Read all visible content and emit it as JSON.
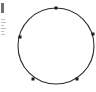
{
  "figure": {
    "background_color": "#ffffff",
    "width": 96,
    "height": 92
  },
  "chart_data": {
    "type": "scatter",
    "subtitle": "",
    "xlabel": "",
    "ylabel": "",
    "grid": false,
    "legend_position": "none",
    "xlim": [
      0,
      96
    ],
    "ylim": [
      0,
      92
    ],
    "shapes": [
      {
        "kind": "circle",
        "label": "outline-circle",
        "cx": 56,
        "cy": 46,
        "r": 38,
        "stroke": "#2b2b2b",
        "stroke_width": 1.1,
        "fill": "none"
      }
    ],
    "categories": [
      "p1",
      "p2",
      "p3",
      "p4",
      "p5"
    ],
    "points": [
      {
        "label": "p1",
        "x": 56,
        "y": 8,
        "angle_deg": 90,
        "marker": "square",
        "size": 3.0,
        "color": "#1a1a1a"
      },
      {
        "label": "p2",
        "x": 20,
        "y": 37,
        "angle_deg": 166,
        "marker": "square",
        "size": 3.0,
        "color": "#1a1a1a"
      },
      {
        "label": "p3",
        "x": 33,
        "y": 79,
        "angle_deg": 239,
        "marker": "square",
        "size": 3.0,
        "color": "#1a1a1a"
      },
      {
        "label": "p4",
        "x": 77,
        "y": 79,
        "angle_deg": 299,
        "marker": "square",
        "size": 3.0,
        "color": "#1a1a1a"
      },
      {
        "label": "p5",
        "x": 93,
        "y": 34,
        "angle_deg": 18,
        "marker": "square",
        "size": 3.0,
        "color": "#1a1a1a"
      }
    ],
    "point_count": 5,
    "values": [
      90,
      166,
      239,
      299,
      18
    ]
  },
  "edge_artifacts": {
    "description": "clipped neighbouring element fragments at left edge",
    "color": "#8a8a8a",
    "accent_color": "#4a4a4a"
  }
}
